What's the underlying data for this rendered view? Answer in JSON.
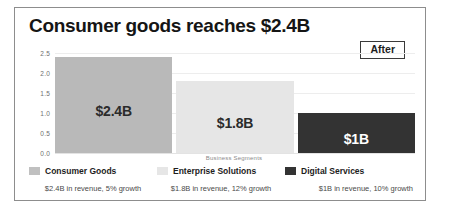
{
  "card": {
    "title": "Consumer goods reaches $2.4B",
    "badge_label": "After"
  },
  "colors": {
    "bar_consumer_goods": "#b9b9b9",
    "bar_enterprise_solutions": "#e6e6e6",
    "bar_digital_services": "#333333",
    "card_border": "#8d8d8d",
    "grid": "#ededed"
  },
  "chart_data": {
    "type": "bar",
    "title": "Consumer goods reaches $2.4B",
    "xlabel": "Business Segments",
    "ylabel": "",
    "categories": [
      "Consumer Goods",
      "Enterprise Solutions",
      "Digital Services"
    ],
    "values": [
      2.4,
      1.8,
      1.0
    ],
    "bar_labels": [
      "$2.4B",
      "$1.8B",
      "$1B"
    ],
    "ylim": [
      0.0,
      2.5
    ],
    "yticks": [
      "2.5",
      "2.0",
      "1.5",
      "1.0",
      "0.5",
      "0.0"
    ],
    "grid": true,
    "legend_position": "bottom"
  },
  "legend": {
    "items": [
      {
        "label": "Consumer Goods"
      },
      {
        "label": "Enterprise Solutions"
      },
      {
        "label": "Digital Services"
      }
    ]
  },
  "footnotes": [
    "$2.4B in revenue, 5% growth",
    "$1.8B in revenue, 12% growth",
    "$1B in revenue, 10% growth"
  ]
}
